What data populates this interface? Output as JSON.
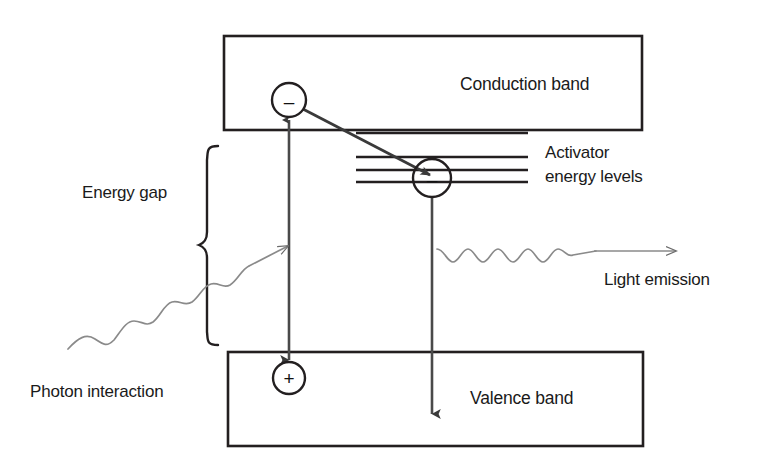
{
  "diagram": {
    "title_present": false,
    "colors": {
      "stroke_dark": "#231f20",
      "stroke_gray": "#6b6b6b",
      "text": "#1a1a1a",
      "background": "#ffffff"
    },
    "bands": [
      {
        "id": "conduction-band",
        "label": "Conduction band",
        "x": 224,
        "y": 36,
        "w": 418,
        "h": 94
      },
      {
        "id": "valence-band",
        "label": "Valence band",
        "x": 228,
        "y": 352,
        "w": 415,
        "h": 94
      }
    ],
    "activator": {
      "label_line1": "Activator",
      "label_line2": "energy levels",
      "level_count": 4,
      "level_y": [
        133,
        157,
        170,
        182
      ],
      "x_start": 356,
      "x_end": 528
    },
    "energy_gap": {
      "label": "Energy gap",
      "brace_top_y": 145,
      "brace_bottom_y": 345
    },
    "carriers": [
      {
        "id": "electron-conduction",
        "sign": "–",
        "cx": 289,
        "cy": 100,
        "r": 17
      },
      {
        "id": "electron-activator",
        "sign": "–",
        "cx": 432,
        "cy": 178,
        "r": 19
      },
      {
        "id": "hole-valence",
        "sign": "+",
        "cx": 289,
        "cy": 378,
        "r": 16
      }
    ],
    "annotations": {
      "photon_interaction": "Photon interaction",
      "light_emission": "Light emission"
    },
    "arrows": [
      {
        "id": "excitation-arrow",
        "type": "double-headed-vertical",
        "x": 289,
        "y1": 118,
        "y2": 360
      },
      {
        "id": "relaxation-arrow",
        "type": "diagonal",
        "from_x": 300,
        "from_y": 110,
        "to_x": 428,
        "to_y": 174
      },
      {
        "id": "recombination-arrow",
        "type": "vertical-down",
        "x": 432,
        "y1": 197,
        "y2": 412
      },
      {
        "id": "incoming-photon-arrow",
        "type": "wave-then-straight",
        "to_x": 287,
        "to_y": 252
      },
      {
        "id": "light-emission-arrow",
        "type": "wave-then-straight",
        "from_x": 436,
        "to_x": 676,
        "y": 252
      }
    ]
  }
}
